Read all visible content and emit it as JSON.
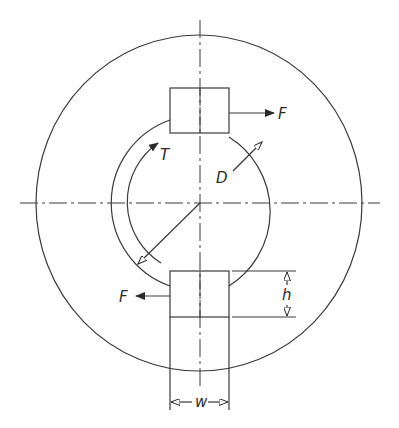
{
  "diagram": {
    "labels": {
      "force_top": "F",
      "force_bottom": "F",
      "torque": "T",
      "diameter": "D",
      "height": "h",
      "width": "w"
    },
    "colors": {
      "line": "#3a3a3a",
      "background": "#ffffff"
    }
  }
}
